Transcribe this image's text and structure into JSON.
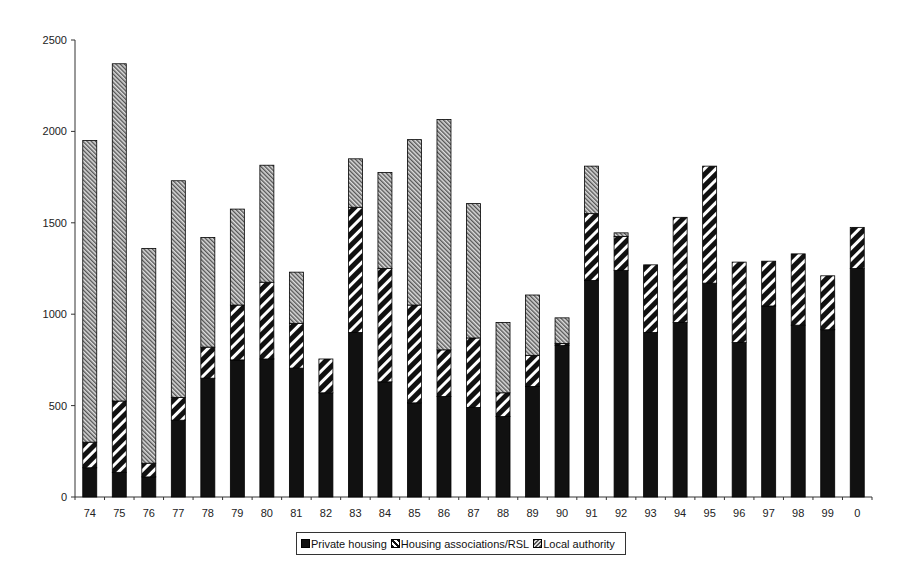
{
  "chart_data": {
    "type": "bar",
    "stacked": true,
    "title": "",
    "xlabel": "",
    "ylabel": "",
    "ylim": [
      0,
      2500
    ],
    "yticks": [
      0,
      500,
      1000,
      1500,
      2000,
      2500
    ],
    "grid": false,
    "legend_position": "bottom",
    "categories": [
      "74",
      "75",
      "76",
      "77",
      "78",
      "79",
      "80",
      "81",
      "82",
      "83",
      "84",
      "85",
      "86",
      "87",
      "88",
      "89",
      "90",
      "91",
      "92",
      "93",
      "94",
      "95",
      "96",
      "97",
      "98",
      "99",
      "0"
    ],
    "series": [
      {
        "name": "Private housing",
        "pattern": "solid-black",
        "values": [
          160,
          135,
          110,
          420,
          650,
          750,
          755,
          705,
          570,
          900,
          630,
          515,
          550,
          490,
          440,
          605,
          830,
          1185,
          1240,
          900,
          955,
          1170,
          845,
          1045,
          940,
          915,
          1250
        ]
      },
      {
        "name": "Housing associations/RSL",
        "pattern": "wide-diagonal-black-white",
        "values": [
          140,
          390,
          75,
          125,
          170,
          300,
          420,
          245,
          185,
          685,
          620,
          535,
          255,
          380,
          130,
          170,
          10,
          365,
          185,
          370,
          575,
          640,
          440,
          245,
          390,
          295,
          225
        ]
      },
      {
        "name": "Local authority",
        "pattern": "fine-diagonal-grey",
        "values": [
          1650,
          1845,
          1175,
          1185,
          600,
          525,
          640,
          280,
          0,
          265,
          525,
          905,
          1260,
          735,
          385,
          330,
          140,
          260,
          20,
          0,
          0,
          0,
          0,
          0,
          0,
          0,
          0
        ]
      }
    ],
    "totals": [
      1950,
      2370,
      1360,
      1730,
      1420,
      1575,
      1815,
      1230,
      755,
      1850,
      1775,
      1955,
      2065,
      1605,
      955,
      1105,
      980,
      1810,
      1445,
      1270,
      1530,
      1810,
      1285,
      1290,
      1330,
      1210,
      1475
    ]
  },
  "legend": {
    "items": [
      {
        "label": "Private housing"
      },
      {
        "label": "Housing associations/RSL"
      },
      {
        "label": "Local authority"
      }
    ]
  }
}
